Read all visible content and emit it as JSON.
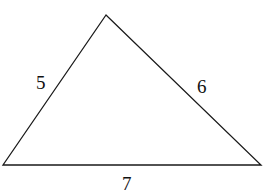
{
  "diagram": {
    "type": "triangle",
    "stroke_color": "#1a1a1a",
    "vertices": {
      "top": [
        106,
        15
      ],
      "bottom_left": [
        3,
        165
      ],
      "bottom_right": [
        261,
        165
      ]
    },
    "sides": [
      {
        "name": "left",
        "label": "5"
      },
      {
        "name": "right",
        "label": "6"
      },
      {
        "name": "bottom",
        "label": "7"
      }
    ]
  }
}
